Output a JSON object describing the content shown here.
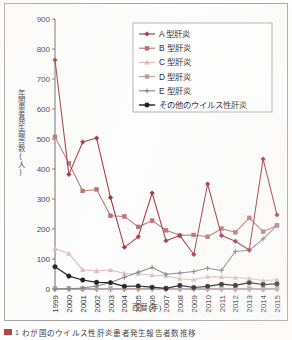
{
  "figure": {
    "caption_number": "1",
    "caption_text": "わが国のウイルス性肝炎患者発生報告者数推移",
    "caption_marker_color": "#b02a2a"
  },
  "axes": {
    "y_title": "年間患者発生報告数(人)",
    "x_title": "西暦(年)",
    "y_ticks": [
      "0",
      "100",
      "200",
      "300",
      "400",
      "500",
      "600",
      "700",
      "800",
      "900"
    ],
    "x_ticks": [
      "1999",
      "2000",
      "2001",
      "2002",
      "2003",
      "2004",
      "2005",
      "2006",
      "2007",
      "2008",
      "2009",
      "2010",
      "2011",
      "2012",
      "2013",
      "2014",
      "2015"
    ]
  },
  "legend": {
    "position": "top-right",
    "items": [
      {
        "label": "A 型肝炎",
        "color": "#9e2630",
        "marker": "diamond"
      },
      {
        "label": "B 型肝炎",
        "color": "#b4676b",
        "marker": "square"
      },
      {
        "label": "C 型肝炎",
        "color": "#dcb5b6",
        "marker": "triangle"
      },
      {
        "label": "D 型肝炎",
        "color": "#b09a9c",
        "marker": "square"
      },
      {
        "label": "E 型肝炎",
        "color": "#7d7d7d",
        "marker": "cross"
      },
      {
        "label": "その他のウイルス性肝炎",
        "color": "#111111",
        "marker": "circle"
      }
    ]
  },
  "chart_data": {
    "type": "line",
    "title": "",
    "xlabel": "西暦(年)",
    "ylabel": "年間患者発生報告数(人)",
    "xlim": [
      1999,
      2015
    ],
    "ylim": [
      0,
      900
    ],
    "ytick_step": 100,
    "grid": false,
    "legend_position": "top-right",
    "x": [
      1999,
      2000,
      2001,
      2002,
      2003,
      2004,
      2005,
      2006,
      2007,
      2008,
      2009,
      2010,
      2011,
      2012,
      2013,
      2014,
      2015
    ],
    "series": [
      {
        "name": "A 型肝炎",
        "color": "#9e2630",
        "marker": "diamond",
        "values": [
          763,
          382,
          490,
          503,
          305,
          139,
          174,
          320,
          161,
          178,
          115,
          350,
          178,
          159,
          130,
          433,
          247
        ]
      },
      {
        "name": "B 型肝炎",
        "color": "#b4676b",
        "marker": "square",
        "values": [
          507,
          419,
          327,
          332,
          244,
          242,
          207,
          228,
          196,
          179,
          180,
          174,
          201,
          189,
          237,
          191,
          212
        ]
      },
      {
        "name": "C 型肝炎",
        "color": "#dcb5b6",
        "marker": "triangle",
        "values": [
          135,
          118,
          64,
          60,
          63,
          52,
          51,
          46,
          44,
          34,
          31,
          41,
          40,
          38,
          35,
          28,
          31
        ]
      },
      {
        "name": "D 型肝炎",
        "color": "#b09a9c",
        "marker": "square",
        "values": [
          2,
          2,
          1,
          1,
          2,
          1,
          2,
          3,
          1,
          1,
          1,
          1,
          2,
          1,
          2,
          1,
          2
        ]
      },
      {
        "name": "E 型肝炎",
        "color": "#7d7d7d",
        "marker": "cross",
        "values": [
          0,
          1,
          3,
          10,
          22,
          39,
          56,
          72,
          49,
          53,
          58,
          69,
          62,
          125,
          129,
          167,
          212
        ]
      },
      {
        "name": "その他のウイルス性肝炎",
        "color": "#111111",
        "marker": "circle",
        "values": [
          74,
          43,
          30,
          22,
          21,
          9,
          10,
          6,
          2,
          12,
          5,
          9,
          16,
          12,
          21,
          15,
          17
        ]
      }
    ]
  }
}
